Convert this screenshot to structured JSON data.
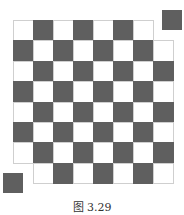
{
  "figure": {
    "caption": "图 3.29",
    "colors": {
      "dark": "#5f5f5f",
      "light": "#ffffff",
      "grid": "#cfcfcf"
    },
    "board": {
      "rows": 8,
      "cols": 8,
      "origin_x": 13,
      "origin_y": 20,
      "cell_w": 20,
      "cell_h": 20.4,
      "first_cell": "light",
      "removed_cells": [
        {
          "row": 0,
          "col": 7
        },
        {
          "row": 7,
          "col": 0
        }
      ]
    },
    "detached_squares": [
      {
        "position": "top-right",
        "x": 162,
        "y": 10,
        "size": 20,
        "color": "dark"
      },
      {
        "position": "bottom-left",
        "x": 3,
        "y": 173,
        "size": 20,
        "color": "dark"
      }
    ]
  }
}
